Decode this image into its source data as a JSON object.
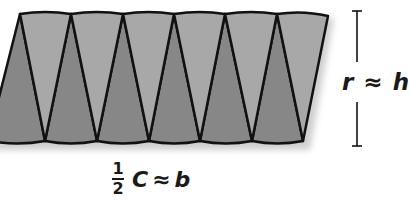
{
  "diagram": {
    "sector_count": 12,
    "colors": {
      "light_sector": "#a8a8a8",
      "dark_sector": "#878787",
      "outline": "#111111",
      "shadow": "#d0d0d0",
      "text": "#1a1a1a"
    },
    "labels": {
      "height": {
        "left_var": "r",
        "approx": "≈",
        "right_var": "h"
      },
      "base": {
        "frac_num": "1",
        "frac_den": "2",
        "left_var": "C",
        "approx": "≈",
        "right_var": "b"
      }
    }
  }
}
